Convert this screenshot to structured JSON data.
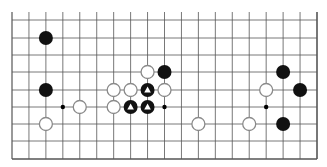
{
  "board": {
    "size": 19,
    "visible_rows": 9,
    "edge": "bottom",
    "colors": {
      "background": "#ffffff",
      "line": "#555555",
      "black_stone": "#111111",
      "white_stone_fill": "#ffffff",
      "white_stone_stroke": "#8a8a8a",
      "marker": "#ffffff"
    },
    "hoshi": [
      {
        "col": 3,
        "row": 5
      },
      {
        "col": 9,
        "row": 5
      },
      {
        "col": 15,
        "row": 5
      }
    ],
    "stones": [
      {
        "color": "black",
        "col": 2,
        "row": 1,
        "marker": null
      },
      {
        "color": "black",
        "col": 2,
        "row": 4,
        "marker": null
      },
      {
        "color": "white",
        "col": 2,
        "row": 6,
        "marker": null
      },
      {
        "color": "white",
        "col": 4,
        "row": 5,
        "marker": null
      },
      {
        "color": "white",
        "col": 8,
        "row": 3,
        "marker": null
      },
      {
        "color": "black",
        "col": 9,
        "row": 3,
        "marker": null
      },
      {
        "color": "white",
        "col": 6,
        "row": 4,
        "marker": null
      },
      {
        "color": "white",
        "col": 7,
        "row": 4,
        "marker": null
      },
      {
        "color": "black",
        "col": 8,
        "row": 4,
        "marker": "triangle"
      },
      {
        "color": "white",
        "col": 9,
        "row": 4,
        "marker": null
      },
      {
        "color": "white",
        "col": 6,
        "row": 5,
        "marker": null
      },
      {
        "color": "black",
        "col": 7,
        "row": 5,
        "marker": "triangle"
      },
      {
        "color": "black",
        "col": 8,
        "row": 5,
        "marker": "triangle"
      },
      {
        "color": "black",
        "col": 16,
        "row": 3,
        "marker": null
      },
      {
        "color": "white",
        "col": 15,
        "row": 4,
        "marker": null
      },
      {
        "color": "black",
        "col": 17,
        "row": 4,
        "marker": null
      },
      {
        "color": "white",
        "col": 11,
        "row": 6,
        "marker": null
      },
      {
        "color": "white",
        "col": 14,
        "row": 6,
        "marker": null
      },
      {
        "color": "black",
        "col": 16,
        "row": 6,
        "marker": null
      }
    ]
  }
}
